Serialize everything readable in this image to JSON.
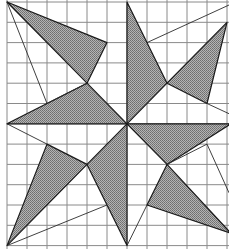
{
  "diagram": {
    "title": "",
    "grid": {
      "columns": 11,
      "rows": 12,
      "origin_px": [
        7,
        2
      ],
      "cell_px": [
        20,
        20.3
      ],
      "line_color": "#8a8a8a"
    },
    "fill_color": "#9a9a9a",
    "stroke_color": "#1a1a1a",
    "shaded_triangles": [
      {
        "name": "top-left-triangle",
        "points": [
          [
            0,
            0
          ],
          [
            5,
            2
          ],
          [
            4,
            4
          ]
        ]
      },
      {
        "name": "left-triangle",
        "points": [
          [
            0,
            6
          ],
          [
            4,
            4
          ],
          [
            6,
            6
          ]
        ]
      },
      {
        "name": "top-triangle",
        "points": [
          [
            6,
            0
          ],
          [
            8,
            4
          ],
          [
            6,
            6
          ]
        ]
      },
      {
        "name": "top-right-triangle",
        "points": [
          [
            8,
            4
          ],
          [
            11,
            1
          ],
          [
            10,
            5
          ]
        ]
      },
      {
        "name": "right-triangle",
        "points": [
          [
            6,
            6
          ],
          [
            11.2,
            6
          ],
          [
            8,
            8
          ]
        ]
      },
      {
        "name": "bottom-right-triangle",
        "points": [
          [
            8,
            8
          ],
          [
            7,
            10
          ],
          [
            11.2,
            11.4
          ]
        ]
      },
      {
        "name": "bottom-triangle",
        "points": [
          [
            6,
            6
          ],
          [
            4,
            8
          ],
          [
            6,
            12
          ]
        ]
      },
      {
        "name": "bottom-left-triangle",
        "points": [
          [
            2,
            7
          ],
          [
            4,
            8
          ],
          [
            0,
            12
          ]
        ]
      }
    ],
    "guide_lines": [
      {
        "name": "line-topleft-to-2-5",
        "points": [
          [
            0,
            0
          ],
          [
            2,
            5
          ],
          [
            4,
            4
          ]
        ]
      },
      {
        "name": "line-top-7-2-to-right",
        "points": [
          [
            7,
            2
          ],
          [
            11.1,
            0.15
          ]
        ]
      },
      {
        "name": "line-10-5-to-right",
        "points": [
          [
            10,
            5
          ],
          [
            11.1,
            5.5
          ]
        ]
      },
      {
        "name": "line-left-0-6-to-2-7",
        "points": [
          [
            0,
            6
          ],
          [
            2,
            7
          ]
        ]
      },
      {
        "name": "line-bottomleft-to-5-10",
        "points": [
          [
            0,
            12
          ],
          [
            5,
            10
          ]
        ]
      },
      {
        "name": "line-8-8-to-10-7",
        "points": [
          [
            8,
            8
          ],
          [
            10,
            7
          ],
          [
            11.1,
            9.4
          ]
        ]
      },
      {
        "name": "line-7-10-to-6-12",
        "points": [
          [
            7,
            10
          ],
          [
            6,
            12
          ]
        ]
      }
    ]
  }
}
